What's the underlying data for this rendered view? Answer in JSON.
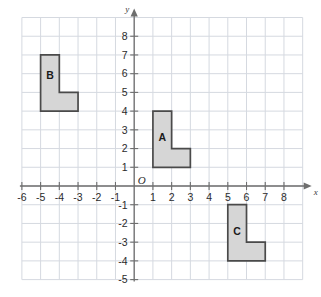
{
  "figure": {
    "title": "",
    "background_color": "#ffffff",
    "grid_color": "#d5d9e0",
    "axis_color": "#6e6e6e",
    "shape_fill": "#d6d6d6",
    "shape_stroke": "#4a4a4a",
    "tick_text_color": "#2b2b2b"
  },
  "axes": {
    "x_axis_name": "x",
    "y_axis_name": "y",
    "origin_label": "O",
    "x_min": -6,
    "x_max": 8,
    "y_min": -5,
    "y_max": 8,
    "x_ticks": [
      "-6",
      "-5",
      "-4",
      "-3",
      "-2",
      "-1",
      "1",
      "2",
      "3",
      "4",
      "5",
      "6",
      "7",
      "8"
    ],
    "x_tick_values": [
      -6,
      -5,
      -4,
      -3,
      -2,
      -1,
      1,
      2,
      3,
      4,
      5,
      6,
      7,
      8
    ],
    "y_ticks": [
      "8",
      "7",
      "6",
      "5",
      "4",
      "3",
      "2",
      "1",
      "-1",
      "-2",
      "-3",
      "-4",
      "-5"
    ],
    "y_tick_values": [
      8,
      7,
      6,
      5,
      4,
      3,
      2,
      1,
      -1,
      -2,
      -3,
      -4,
      -5
    ],
    "grid_on": true,
    "grid_step": 1
  },
  "chart_data": {
    "type": "scatter",
    "title": "",
    "xlabel": "x",
    "ylabel": "y",
    "xlim": [
      -6,
      8
    ],
    "ylim": [
      -5,
      8
    ],
    "grid": true,
    "shapes": [
      {
        "label": "A",
        "label_point": [
          1.5,
          2.4
        ],
        "vertices": [
          [
            1,
            1
          ],
          [
            1,
            4
          ],
          [
            2,
            4
          ],
          [
            2,
            2
          ],
          [
            3,
            2
          ],
          [
            3,
            1
          ]
        ],
        "fill": "#d6d6d6",
        "stroke": "#4a4a4a"
      },
      {
        "label": "B",
        "label_point": [
          -4.5,
          5.7
        ],
        "vertices": [
          [
            -5,
            4
          ],
          [
            -5,
            7
          ],
          [
            -4,
            7
          ],
          [
            -4,
            5
          ],
          [
            -3,
            5
          ],
          [
            -3,
            4
          ]
        ],
        "fill": "#d6d6d6",
        "stroke": "#4a4a4a"
      },
      {
        "label": "C",
        "label_point": [
          5.5,
          -2.6
        ],
        "vertices": [
          [
            5,
            -4
          ],
          [
            5,
            -1
          ],
          [
            6,
            -1
          ],
          [
            6,
            -3
          ],
          [
            7,
            -3
          ],
          [
            7,
            -4
          ]
        ],
        "fill": "#d6d6d6",
        "stroke": "#4a4a4a"
      }
    ]
  }
}
